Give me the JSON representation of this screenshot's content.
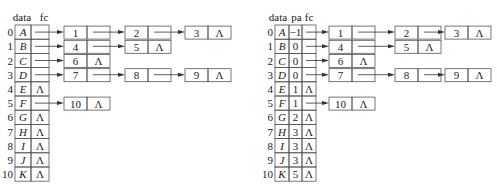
{
  "null_symbol": "Λ",
  "left": {
    "headers": [
      "data",
      "fc"
    ],
    "rows": [
      {
        "index": "0",
        "data": "A",
        "children": [
          "1",
          "2",
          "3"
        ]
      },
      {
        "index": "1",
        "data": "B",
        "children": [
          "4",
          "5"
        ]
      },
      {
        "index": "2",
        "data": "C",
        "children": [
          "6"
        ]
      },
      {
        "index": "3",
        "data": "D",
        "children": [
          "7",
          "8",
          "9"
        ]
      },
      {
        "index": "4",
        "data": "E",
        "children": []
      },
      {
        "index": "5",
        "data": "F",
        "children": [
          "10"
        ]
      },
      {
        "index": "6",
        "data": "G",
        "children": []
      },
      {
        "index": "7",
        "data": "H",
        "children": []
      },
      {
        "index": "8",
        "data": "I",
        "children": []
      },
      {
        "index": "9",
        "data": "J",
        "children": []
      },
      {
        "index": "10",
        "data": "K",
        "children": []
      }
    ]
  },
  "right": {
    "headers": [
      "data",
      "pa",
      "fc"
    ],
    "rows": [
      {
        "index": "0",
        "data": "A",
        "pa": "−1",
        "children": [
          "1",
          "2",
          "3"
        ]
      },
      {
        "index": "1",
        "data": "B",
        "pa": "0",
        "children": [
          "4",
          "5"
        ]
      },
      {
        "index": "2",
        "data": "C",
        "pa": "0",
        "children": [
          "6"
        ]
      },
      {
        "index": "3",
        "data": "D",
        "pa": "0",
        "children": [
          "7",
          "8",
          "9"
        ]
      },
      {
        "index": "4",
        "data": "E",
        "pa": "1",
        "children": []
      },
      {
        "index": "5",
        "data": "F",
        "pa": "1",
        "children": [
          "10"
        ]
      },
      {
        "index": "6",
        "data": "G",
        "pa": "2",
        "children": []
      },
      {
        "index": "7",
        "data": "H",
        "pa": "3",
        "children": []
      },
      {
        "index": "8",
        "data": "I",
        "pa": "3",
        "children": []
      },
      {
        "index": "9",
        "data": "J",
        "pa": "3",
        "children": []
      },
      {
        "index": "10",
        "data": "K",
        "pa": "5",
        "children": []
      }
    ]
  }
}
